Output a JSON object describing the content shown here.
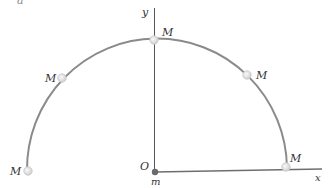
{
  "figure": {
    "corner_label": "a",
    "axes": {
      "x_label": "x",
      "y_label": "y",
      "origin_label": "O",
      "origin_mass_label": "m"
    },
    "path": {
      "type": "semicircle",
      "color": "#8a8a8a"
    },
    "points": [
      {
        "label": "M",
        "position": "bottom-left"
      },
      {
        "label": "M",
        "position": "upper-left"
      },
      {
        "label": "M",
        "position": "top"
      },
      {
        "label": "M",
        "position": "upper-right"
      },
      {
        "label": "M",
        "position": "bottom-right"
      }
    ],
    "colors": {
      "axis": "#555555",
      "x_axis": "#777777",
      "marker_fill": "#e4e4e4",
      "marker_stroke": "#c8c8c8",
      "origin_dot": "#6a6a6a",
      "text": "#333333"
    }
  }
}
